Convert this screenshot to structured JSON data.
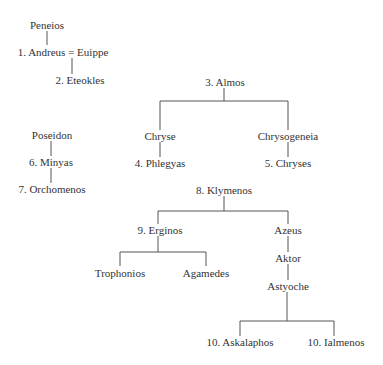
{
  "diagram": {
    "type": "genealogy",
    "nodes": {
      "peneios": "Peneios",
      "andreus_euippe": "1. Andreus = Euippe",
      "eteokles": "2. Eteokles",
      "almos": "3. Almos",
      "chryse": "Chryse",
      "chrysogeneia": "Chrysogeneia",
      "phlegyas": "4. Phlegyas",
      "chryses": "5. Chryses",
      "poseidon": "Poseidon",
      "minyas": "6. Minyas",
      "orchomenos": "7. Orchomenos",
      "klymenos": "8. Klymenos",
      "erginos": "9. Erginos",
      "azeus": "Azeus",
      "trophonios": "Trophonios",
      "agamedes": "Agamedes",
      "aktor": "Aktor",
      "astyoche": "Astyoche",
      "askalaphos": "10. Askalaphos",
      "ialmenos": "10. Ialmenos"
    },
    "edges": [
      [
        "Peneios",
        "1. Andreus"
      ],
      [
        "1. Andreus = Euippe",
        "2. Eteokles"
      ],
      [
        "3. Almos",
        "Chryse"
      ],
      [
        "3. Almos",
        "Chrysogeneia"
      ],
      [
        "Chryse",
        "4. Phlegyas"
      ],
      [
        "Chrysogeneia",
        "5. Chryses"
      ],
      [
        "Poseidon",
        "6. Minyas"
      ],
      [
        "6. Minyas",
        "7. Orchomenos"
      ],
      [
        "8. Klymenos",
        "9. Erginos"
      ],
      [
        "8. Klymenos",
        "Azeus"
      ],
      [
        "9. Erginos",
        "Trophonios"
      ],
      [
        "9. Erginos",
        "Agamedes"
      ],
      [
        "Azeus",
        "Aktor"
      ],
      [
        "Aktor",
        "Astyoche"
      ],
      [
        "Astyoche",
        "10. Askalaphos"
      ],
      [
        "Astyoche",
        "10. Ialmenos"
      ]
    ]
  }
}
